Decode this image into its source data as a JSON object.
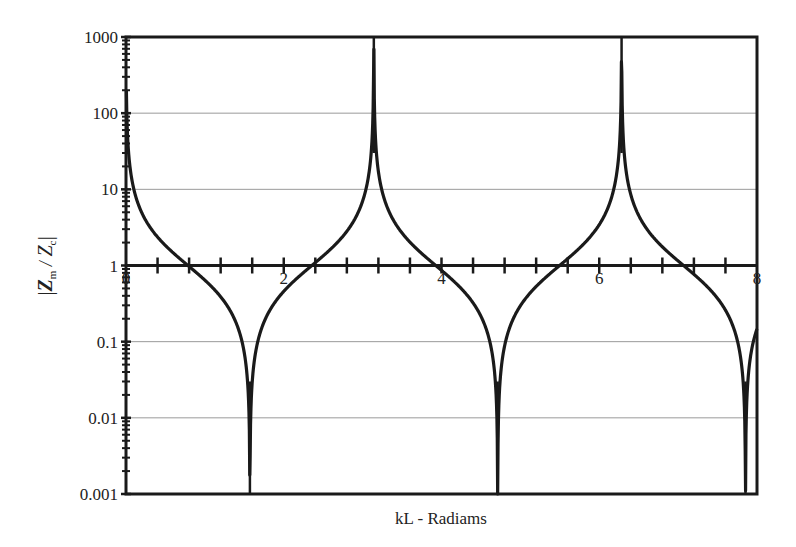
{
  "chart_data": {
    "type": "line",
    "title": "",
    "xlabel": "kL - Radiams",
    "ylabel": "|Z_m / Z_c|",
    "ylabel_parts": {
      "bar_left": "|",
      "z1": "Z",
      "sub1": "m",
      "slash": " / ",
      "z2": "Z",
      "sub2": "c",
      "bar_right": "|"
    },
    "yscale": "log",
    "xlim": [
      0,
      8
    ],
    "ylim": [
      0.001,
      1000
    ],
    "x_axis_crosses_y_at": 1,
    "x_ticks": [
      0,
      2,
      4,
      6,
      8
    ],
    "x_tick_labels": [
      "0",
      "2",
      "4",
      "6",
      "8"
    ],
    "x_minor_tick_step": 0.4,
    "y_ticks": [
      0.001,
      0.01,
      0.1,
      1,
      10,
      100,
      1000
    ],
    "y_tick_labels": [
      "0.001",
      "0.01",
      "0.1",
      "1",
      "10",
      "100",
      "1000"
    ],
    "grid": {
      "horizontal": true,
      "vertical": false
    },
    "legend": null,
    "series": [
      {
        "name": "|Zm/Zc| = |cot(kL)|",
        "function": "abs_cot",
        "x_start": 0.005,
        "x_end": 8,
        "samples": 1600,
        "clip_min": 0.001,
        "clip_max": 1000,
        "color": "#1a1a1a",
        "annotated_points": [
          {
            "x": 0.785,
            "y": 1
          },
          {
            "x": 1.571,
            "y": 0.001
          },
          {
            "x": 2.356,
            "y": 1
          },
          {
            "x": 3.142,
            "y": 1000
          },
          {
            "x": 3.927,
            "y": 1
          },
          {
            "x": 4.712,
            "y": 0.001
          },
          {
            "x": 5.498,
            "y": 1
          },
          {
            "x": 6.283,
            "y": 1000
          },
          {
            "x": 7.069,
            "y": 1
          },
          {
            "x": 7.854,
            "y": 0.001
          }
        ]
      }
    ]
  },
  "colors": {
    "line": "#1a1a1a",
    "axis": "#1a1a1a",
    "grid": "#9a9a9a",
    "background": "#ffffff"
  }
}
